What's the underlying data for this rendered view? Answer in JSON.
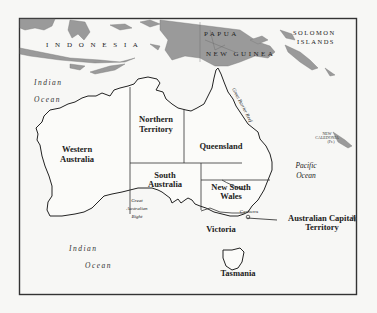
{
  "map": {
    "frame": {
      "x": 19,
      "y": 18,
      "width": 337,
      "height": 276
    },
    "colors": {
      "land_other": "#9a9a9a",
      "background": "#f7f7f5",
      "line": "#222222"
    },
    "countries": {
      "indonesia": "I N D O N E S I A",
      "papua_line1": "PAPUA",
      "papua_line2": "NEW GUINEA",
      "solomon_line1": "SOLOMON",
      "solomon_line2": "ISLANDS",
      "new_caledonia_line1": "NEW",
      "new_caledonia_line2": "CALEDONIA",
      "new_caledonia_line3": "(Fr.)"
    },
    "oceans": {
      "indian_nw_1": "Indian",
      "indian_nw_2": "Ocean",
      "indian_s_1": "Indian",
      "indian_s_2": "Ocean",
      "pacific_1": "Pacific",
      "pacific_2": "Ocean",
      "bight_1": "Great",
      "bight_2": "Australian",
      "bight_3": "Bight",
      "reef": "Great Barrier Reef"
    },
    "states": {
      "wa_1": "Western",
      "wa_2": "Australia",
      "nt_1": "Northern",
      "nt_2": "Territory",
      "qld": "Queensland",
      "sa_1": "South",
      "sa_2": "Australia",
      "nsw_1": "New South",
      "nsw_2": "Wales",
      "vic": "Victoria",
      "tas": "Tasmania",
      "act_1": "Australian Capital",
      "act_2": "Territory"
    },
    "cities": {
      "canberra": "Canberra"
    }
  }
}
